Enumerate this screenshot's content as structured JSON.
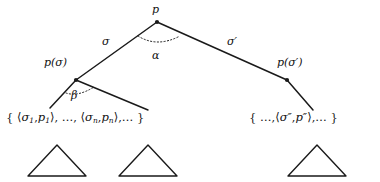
{
  "figure": {
    "type": "tree-diagram",
    "background_color": "#ffffff",
    "stroke_color": "#1a1a1a"
  },
  "nodes": {
    "root": {
      "label": "p",
      "x": 157,
      "y": 22
    },
    "left_child": {
      "label": "p(σ)",
      "x": 76,
      "y": 80
    },
    "right_child": {
      "label": "p(σ′)",
      "x": 287,
      "y": 80
    }
  },
  "edges": {
    "left_branch_label": "σ",
    "right_branch_label": "σ′"
  },
  "angles": {
    "root_angle_label": "α",
    "left_node_angle_label": "β"
  },
  "sets": {
    "left": {
      "open_brace": "{",
      "first_pair_open": "⟨",
      "first_sigma": "σ",
      "first_sigma_sub": "1",
      "first_comma": ",",
      "first_p": "p",
      "first_p_sub": "1",
      "first_pair_close": "⟩",
      "sep1": ",",
      "ellipsis1": "…",
      "sep2": ",",
      "last_pair_open": "⟨",
      "last_sigma": "σ",
      "last_sigma_sub": "n",
      "last_comma": ",",
      "last_p": "p",
      "last_p_sub": "n",
      "last_pair_close": "⟩",
      "sep3": ",",
      "ellipsis2": "…",
      "close_brace": "}"
    },
    "right": {
      "open_brace": "{",
      "ellipsis1": "…",
      "sep1": ",",
      "pair_open": "⟨",
      "sigma": "σ″",
      "comma": ",",
      "p": "p″",
      "pair_close": "⟩",
      "sep2": ",",
      "ellipsis2": "…",
      "close_brace": "}"
    }
  },
  "subtrees": [
    {
      "name": "subtree-1",
      "cx": 57,
      "apex_y": 145,
      "base_y": 176,
      "half_width": 29
    },
    {
      "name": "subtree-2",
      "cx": 148,
      "apex_y": 145,
      "base_y": 176,
      "half_width": 29
    },
    {
      "name": "subtree-3",
      "cx": 317,
      "apex_y": 145,
      "base_y": 176,
      "half_width": 29
    }
  ]
}
